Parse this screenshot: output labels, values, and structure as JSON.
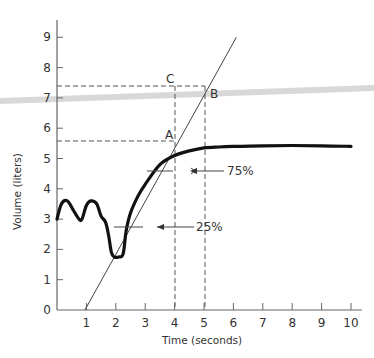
{
  "chart_data": {
    "type": "line",
    "title": "",
    "xlabel": "Time (seconds)",
    "ylabel": "Volume (liters)",
    "xlim": [
      0,
      10
    ],
    "ylim": [
      0,
      9.5
    ],
    "x_ticks": [
      "1",
      "2",
      "3",
      "4",
      "5",
      "6",
      "7",
      "8",
      "9",
      "10"
    ],
    "y_ticks": [
      "0",
      "1",
      "2",
      "3",
      "4",
      "5",
      "6",
      "7",
      "8",
      "9"
    ],
    "grid": false,
    "series": [
      {
        "name": "Volume curve",
        "x": [
          0.0,
          0.15,
          0.35,
          0.55,
          0.75,
          0.85,
          1.0,
          1.15,
          1.35,
          1.5,
          1.65,
          1.75,
          1.85,
          1.95,
          2.1,
          2.25,
          2.35,
          2.5,
          2.75,
          3.0,
          3.5,
          4.0,
          4.5,
          5.0,
          5.5,
          6.0,
          7.0,
          8.0,
          9.0,
          10.0
        ],
        "y": [
          3.0,
          3.5,
          3.6,
          3.3,
          3.0,
          3.0,
          3.45,
          3.6,
          3.5,
          3.1,
          2.9,
          2.5,
          1.9,
          1.75,
          1.75,
          1.85,
          2.6,
          3.2,
          3.75,
          4.15,
          4.8,
          5.1,
          5.25,
          5.35,
          5.38,
          5.4,
          5.42,
          5.43,
          5.42,
          5.4
        ]
      },
      {
        "name": "Tangent line",
        "x": [
          0.95,
          6.1
        ],
        "y": [
          0.0,
          9.0
        ]
      }
    ],
    "annotations": [
      {
        "label": "A",
        "x": 4,
        "y": 5.6
      },
      {
        "label": "B",
        "x": 5,
        "y": 7.4
      },
      {
        "label": "C",
        "x": 4,
        "y": 7.4
      },
      {
        "label": "75%",
        "y": 4.6,
        "arrow_x": 4.5
      },
      {
        "label": "25%",
        "y": 2.75,
        "arrow_x": 3.5
      }
    ],
    "reference_lines": {
      "vertical_dashed": [
        4,
        5
      ],
      "horizontal_dashed": [
        5.6,
        7.4
      ]
    }
  },
  "labels": {
    "x_axis_title": "Time (seconds)",
    "y_axis_title": "Volume (liters)",
    "point_a": "A",
    "point_b": "B",
    "point_c": "C",
    "pct_75": "75%",
    "pct_25": "25%"
  }
}
